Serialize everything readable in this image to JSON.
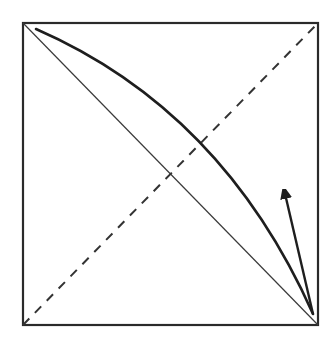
{
  "diagram": {
    "canvas": {
      "width": 334,
      "height": 338,
      "background": "#ffffff"
    },
    "colors": {
      "frame": "#2a2a2a",
      "diagonal": "#3a3a3a",
      "dashed": "#333333",
      "curve": "#1e1e1e",
      "arrow": "#1e1e1e"
    },
    "frame": {
      "x": 23,
      "y": 23,
      "width": 295,
      "height": 302
    },
    "solid_diagonal": {
      "from": [
        23,
        23
      ],
      "to": [
        318,
        325
      ]
    },
    "dashed_diagonal": {
      "from": [
        23,
        325
      ],
      "to": [
        318,
        23
      ]
    },
    "curve": {
      "start": [
        36,
        29
      ],
      "control1": [
        130,
        70
      ],
      "control2": [
        240,
        150
      ],
      "end": [
        313,
        314
      ]
    },
    "arrow": {
      "from": [
        313,
        314
      ],
      "to": [
        283,
        185
      ]
    },
    "labels": []
  }
}
